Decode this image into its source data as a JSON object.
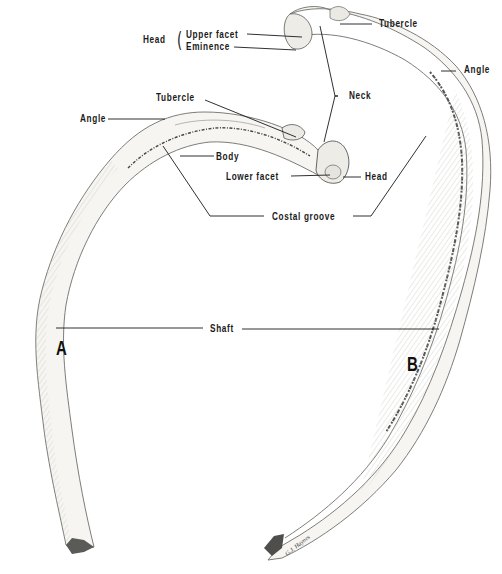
{
  "figure": {
    "rib_a": {
      "letter": "A",
      "labels": {
        "angle": "Angle",
        "tubercle": "Tubercle",
        "body": "Body",
        "lower_facet": "Lower facet",
        "head": "Head"
      }
    },
    "rib_b": {
      "letter": "B",
      "labels": {
        "head": "Head",
        "upper_facet": "Upper facet",
        "eminence": "Eminence",
        "tubercle": "Tubercle",
        "angle": "Angle"
      }
    },
    "shared_labels": {
      "neck": "Neck",
      "costal_groove": "Costal groove",
      "shaft": "Shaft"
    },
    "signature": "G.J. Haynes",
    "colors": {
      "background": "#ffffff",
      "ink": "#1a1a1a",
      "bone_fill": "#f4f3ef",
      "bone_shade": "#8a8a86"
    }
  }
}
